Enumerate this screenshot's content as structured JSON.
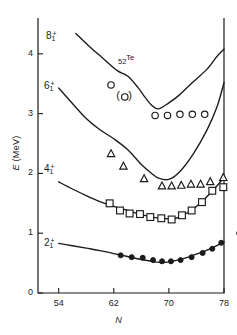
{
  "chart_data": {
    "type": "scatter",
    "title": "52Te",
    "title_z": "52",
    "title_element": "Te",
    "xlabel": "N",
    "ylabel": "E (MeV)",
    "xlim": [
      51,
      78
    ],
    "ylim": [
      0,
      4.6
    ],
    "xticks": [
      54,
      62,
      70,
      78
    ],
    "yticks": [
      0,
      1,
      2,
      3,
      4
    ],
    "grid": false,
    "legend": "none",
    "state_labels": [
      {
        "name": "8-1-plus",
        "spin": "8",
        "sub": "1",
        "sup": "+",
        "text": "8",
        "y_mev": 4.28
      },
      {
        "name": "6-1-plus",
        "spin": "6",
        "sub": "1",
        "sup": "+",
        "text": "6",
        "y_mev": 3.45
      },
      {
        "name": "4-1-plus",
        "spin": "4",
        "sub": "1",
        "sup": "+",
        "text": "4",
        "y_mev": 2.05
      },
      {
        "name": "2-1-plus",
        "spin": "2",
        "sub": "1",
        "sup": "+",
        "text": "2",
        "y_mev": 0.82
      }
    ],
    "series": [
      {
        "name": "8_1+ curve",
        "marker": "none",
        "style": "solid-line",
        "x": [
          56.5,
          58.5,
          60.5,
          62.5,
          64.0,
          65.5,
          66.5,
          67.5,
          68.5,
          70.0,
          71.5,
          73.5,
          75.5,
          77.0,
          78.0
        ],
        "y": [
          4.34,
          4.12,
          3.92,
          3.72,
          3.63,
          3.44,
          3.28,
          3.14,
          3.08,
          3.18,
          3.31,
          3.53,
          3.74,
          3.96,
          4.08
        ]
      },
      {
        "name": "6_1+ curve",
        "marker": "none",
        "style": "solid-line",
        "x": [
          54.0,
          56.0,
          58.0,
          60.0,
          62.0,
          64.0,
          66.0,
          67.5,
          68.5,
          70.0,
          71.5,
          73.5,
          75.5,
          77.0,
          78.0
        ],
        "y": [
          3.43,
          3.17,
          2.92,
          2.73,
          2.58,
          2.4,
          2.15,
          2.0,
          1.92,
          1.9,
          2.02,
          2.32,
          2.72,
          3.12,
          3.52
        ]
      },
      {
        "name": "4_1+ curve",
        "marker": "none",
        "style": "solid-line",
        "x": [
          54.0,
          56.0,
          58.0,
          60.0,
          62.0,
          64.0,
          66.0,
          68.0,
          70.0,
          71.0,
          72.0,
          73.5,
          75.0,
          76.5,
          78.0
        ],
        "y": [
          1.86,
          1.74,
          1.63,
          1.53,
          1.45,
          1.38,
          1.31,
          1.26,
          1.24,
          1.25,
          1.3,
          1.4,
          1.55,
          1.73,
          1.93
        ]
      },
      {
        "name": "2_1+ curve",
        "marker": "none",
        "style": "solid-line",
        "x": [
          54.0,
          56.0,
          58.0,
          60.0,
          62.0,
          64.0,
          66.0,
          68.0,
          69.0,
          70.0,
          72.0,
          74.0,
          76.0,
          78.0
        ],
        "y": [
          0.83,
          0.79,
          0.75,
          0.71,
          0.66,
          0.61,
          0.56,
          0.52,
          0.51,
          0.52,
          0.57,
          0.65,
          0.74,
          0.85
        ]
      },
      {
        "name": "6_1+ data (open circles)",
        "marker": "open-circle",
        "x": [
          61.6,
          63.6,
          68.0,
          69.8,
          71.6,
          73.4,
          75.2
        ],
        "y": [
          3.48,
          3.28,
          2.97,
          2.97,
          2.99,
          2.99,
          2.99
        ],
        "parenthesized_index": 1
      },
      {
        "name": "4_1+ data (open triangles)",
        "marker": "open-triangle",
        "x": [
          61.6,
          63.4,
          66.4,
          69.0,
          70.4,
          71.8,
          73.2,
          74.6,
          76.0,
          77.9
        ],
        "y": [
          2.33,
          2.12,
          1.91,
          1.79,
          1.79,
          1.8,
          1.82,
          1.82,
          1.86,
          1.93
        ]
      },
      {
        "name": "4_1+ data (open squares)",
        "marker": "open-square",
        "x": [
          61.4,
          62.9,
          64.3,
          65.8,
          67.3,
          68.9,
          70.4,
          71.9,
          73.3,
          74.8,
          76.3,
          77.9
        ],
        "y": [
          1.5,
          1.38,
          1.33,
          1.32,
          1.27,
          1.25,
          1.23,
          1.3,
          1.38,
          1.52,
          1.71,
          1.77
        ]
      },
      {
        "name": "2_1+ data (filled circles)",
        "marker": "filled-circle",
        "x": [
          63.0,
          64.6,
          66.2,
          67.7,
          69.0,
          70.3,
          71.7,
          73.3,
          74.9,
          76.3,
          77.6,
          80.2
        ],
        "y": [
          0.63,
          0.6,
          0.59,
          0.55,
          0.53,
          0.53,
          0.55,
          0.6,
          0.67,
          0.74,
          0.84,
          1.0
        ]
      }
    ]
  },
  "axis": {
    "ytick_labels": [
      "0",
      "1",
      "2",
      "3",
      "4"
    ],
    "xtick_labels": [
      "54",
      "62",
      "70",
      "78"
    ],
    "ylabel_E": "E",
    "ylabel_unit": "(MeV)",
    "xlabel": "N"
  },
  "colors": {
    "line": "#1a1a1a",
    "frame": "#1a1a1a",
    "background": "#ffffff"
  }
}
